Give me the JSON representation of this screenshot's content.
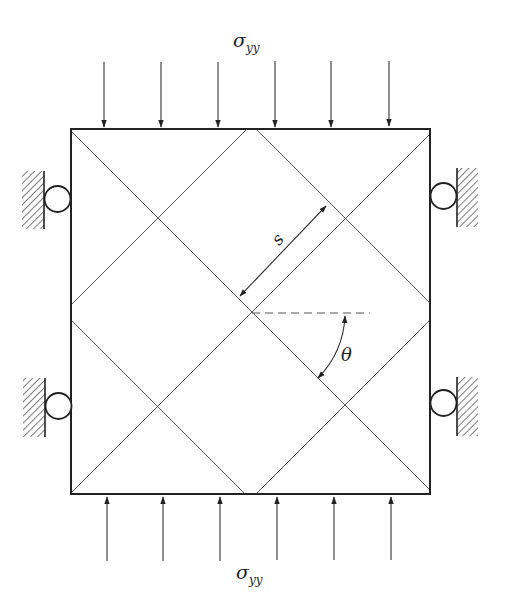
{
  "diagram": {
    "type": "mechanics-schematic",
    "top_load_label": "σ",
    "top_load_subscript": "yy",
    "bottom_load_label": "σ",
    "bottom_load_subscript": "yy",
    "spacing_label": "s",
    "angle_label": "θ",
    "colors": {
      "stroke": "#222222",
      "grid_line": "#555555",
      "dashed": "#555555",
      "background": "#ffffff"
    },
    "square": {
      "x1": 71,
      "y1": 129,
      "x2": 430,
      "y2": 494
    },
    "load_arrows_top_x": [
      104,
      161,
      218,
      275,
      331,
      389
    ],
    "load_arrows_bottom_x": [
      107,
      163,
      220,
      277,
      334,
      391
    ],
    "supports": [
      {
        "side": "left",
        "position": "upper"
      },
      {
        "side": "left",
        "position": "lower"
      },
      {
        "side": "right",
        "position": "upper"
      },
      {
        "side": "right",
        "position": "lower"
      }
    ]
  }
}
